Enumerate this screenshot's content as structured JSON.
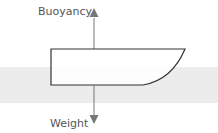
{
  "diagram": {
    "labels": {
      "buoyancy": "Buoyancy",
      "weight": "Weight"
    },
    "colors": {
      "water": "#ececec",
      "hull_stroke": "#333333",
      "hull_fill": "#ffffff",
      "arrow": "#777777",
      "text": "#555555"
    },
    "elements": [
      {
        "name": "water-band",
        "type": "region"
      },
      {
        "name": "hull",
        "type": "shape"
      },
      {
        "name": "buoyancy-arrow",
        "direction": "up"
      },
      {
        "name": "weight-arrow",
        "direction": "down"
      }
    ]
  }
}
